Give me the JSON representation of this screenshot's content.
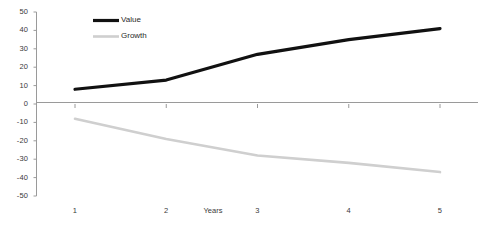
{
  "chart_data": {
    "type": "line",
    "title": "",
    "xlabel": "Years",
    "ylabel": "",
    "x": [
      1,
      2,
      3,
      4,
      5
    ],
    "categories": [
      "1",
      "2",
      "3",
      "4",
      "5"
    ],
    "ylim": [
      -50,
      50
    ],
    "xlim": [
      0.6,
      5.4
    ],
    "grid": false,
    "legend_position": "top-left-inside",
    "y_ticks": [
      50,
      40,
      30,
      20,
      10,
      0,
      -10,
      -20,
      -30,
      -40,
      -50
    ],
    "y_tick_labels": [
      "50",
      "40",
      "30",
      "20",
      "10",
      "0",
      "-10",
      "-20",
      "-30",
      "-40",
      "-50"
    ],
    "x_tick_labels": [
      "1",
      "2",
      "3",
      "4",
      "5"
    ],
    "series": [
      {
        "name": "Value",
        "color": "#111111",
        "width": 3.2,
        "values": [
          8,
          13,
          27,
          35,
          41
        ]
      },
      {
        "name": "Growth",
        "color": "#cfcfcf",
        "width": 2.6,
        "values": [
          -8,
          -19,
          -28,
          -32,
          -37
        ]
      }
    ],
    "axis_color": "#9a9a9a",
    "text_color": "#3a3a3a",
    "background": "#ffffff"
  },
  "legend": {
    "items": [
      {
        "label": "Value"
      },
      {
        "label": "Growth"
      }
    ]
  },
  "axes": {
    "x_axis_title": "Years"
  }
}
